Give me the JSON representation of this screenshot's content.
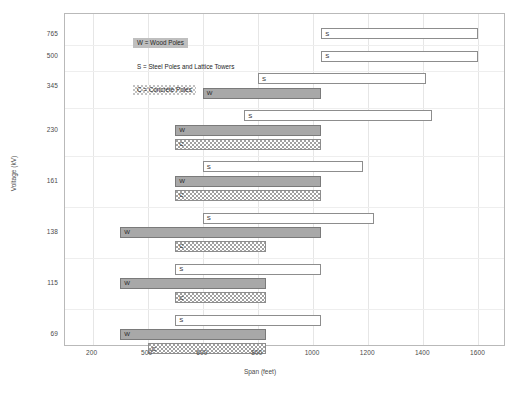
{
  "chart_data": {
    "type": "bar",
    "orientation": "horizontal",
    "title": "",
    "xlabel": "Span (feet)",
    "ylabel": "Voltage (kV)",
    "xlim": [
      100,
      1700
    ],
    "xticks": [
      "200",
      "500",
      "600",
      "800",
      "1000",
      "1200",
      "1400",
      "1600"
    ],
    "xtick_values": [
      200,
      400,
      600,
      800,
      1000,
      1200,
      1400,
      1600
    ],
    "yticks": [
      "765",
      "500",
      "345",
      "230",
      "161",
      "138",
      "115",
      "69"
    ],
    "grid": "vertical",
    "legend_position": "top-left",
    "series": [
      {
        "name": "W = Wood Poles",
        "code": "W"
      },
      {
        "name": "S = Steel Poles and Lattice Towers",
        "code": "S"
      },
      {
        "name": "C = Concrete Poles",
        "code": "C"
      }
    ],
    "groups": [
      {
        "voltage": "765",
        "bars": [
          {
            "code": "S",
            "label": "S",
            "start": 1030,
            "end": 1600
          }
        ]
      },
      {
        "voltage": "500",
        "bars": [
          {
            "code": "S",
            "label": "S",
            "start": 1030,
            "end": 1600
          }
        ]
      },
      {
        "voltage": "345",
        "bars": [
          {
            "code": "S",
            "label": "S",
            "start": 800,
            "end": 1410
          },
          {
            "code": "W",
            "label": "W",
            "start": 600,
            "end": 1030
          }
        ]
      },
      {
        "voltage": "230",
        "bars": [
          {
            "code": "S",
            "label": "S",
            "start": 750,
            "end": 1430
          },
          {
            "code": "W",
            "label": "W",
            "start": 500,
            "end": 1030
          },
          {
            "code": "C",
            "label": "C",
            "start": 500,
            "end": 1030
          }
        ]
      },
      {
        "voltage": "161",
        "bars": [
          {
            "code": "S",
            "label": "S",
            "start": 600,
            "end": 1180
          },
          {
            "code": "W",
            "label": "W",
            "start": 500,
            "end": 1030
          },
          {
            "code": "C",
            "label": "C",
            "start": 500,
            "end": 1030
          }
        ]
      },
      {
        "voltage": "138",
        "bars": [
          {
            "code": "S",
            "label": "S",
            "start": 600,
            "end": 1220
          },
          {
            "code": "W",
            "label": "W",
            "start": 300,
            "end": 1030
          },
          {
            "code": "C",
            "label": "C",
            "start": 500,
            "end": 830
          }
        ]
      },
      {
        "voltage": "115",
        "bars": [
          {
            "code": "S",
            "label": "S",
            "start": 500,
            "end": 1030
          },
          {
            "code": "W",
            "label": "W",
            "start": 300,
            "end": 830
          },
          {
            "code": "C",
            "label": "C",
            "start": 500,
            "end": 830
          }
        ]
      },
      {
        "voltage": "69",
        "bars": [
          {
            "code": "S",
            "label": "S",
            "start": 500,
            "end": 1030
          },
          {
            "code": "W",
            "label": "W",
            "start": 300,
            "end": 830
          },
          {
            "code": "C",
            "label": "C",
            "start": 400,
            "end": 830
          }
        ]
      }
    ]
  },
  "legend": {
    "items": [
      {
        "code": "W",
        "text": "W = Wood Poles"
      },
      {
        "code": "S",
        "text": "S = Steel Poles and Lattice Towers"
      },
      {
        "code": "C",
        "text": "C = Concrete Poles"
      }
    ]
  },
  "colors": {
    "wood": "#a8a8a8",
    "steel": "#ffffff",
    "concrete": "#ffffff",
    "border": "#8d8d8d",
    "grid": "#e6e6e6",
    "text": "#4a4a4a"
  }
}
